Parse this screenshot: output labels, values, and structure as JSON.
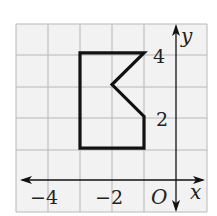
{
  "figure": {
    "type": "coordinate-plane-polygon",
    "grid": {
      "x_min": -5,
      "x_max": 1,
      "y_min": -1,
      "y_max": 5,
      "step": 1,
      "background": "#f2f2f2",
      "line_color": "#b8b8b8"
    },
    "axes": {
      "x_label": "x",
      "y_label": "y",
      "origin_label": "O",
      "x_ticks": [
        {
          "value": -4,
          "label": "−4"
        },
        {
          "value": -2,
          "label": "−2"
        }
      ],
      "y_ticks": [
        {
          "value": 4,
          "label": "4"
        },
        {
          "value": 2,
          "label": "2"
        }
      ]
    },
    "polygon": {
      "vertices": [
        [
          -3,
          4
        ],
        [
          -1,
          4
        ],
        [
          -2,
          3
        ],
        [
          -1,
          2
        ],
        [
          -1,
          1
        ],
        [
          -3,
          1
        ]
      ],
      "stroke": "#111111"
    }
  }
}
